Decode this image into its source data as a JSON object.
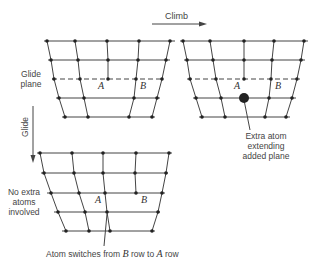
{
  "labels": {
    "climb": "Climb",
    "glide": "Glide",
    "glide_plane_l1": "Glide",
    "glide_plane_l2": "plane",
    "extra_atom_l1": "Extra atom",
    "extra_atom_l2": "extending",
    "extra_atom_l3": "added plane",
    "no_extra_l1": "No extra",
    "no_extra_l2": "atoms",
    "no_extra_l3": "involved",
    "switch_caption_pre": "Atom switches from ",
    "switch_caption_b": "B",
    "switch_caption_mid": " row to ",
    "switch_caption_a": "A",
    "switch_caption_post": " row"
  },
  "atom_labels": {
    "top_left_A": "A",
    "top_left_B": "B",
    "top_right_A": "A",
    "top_right_B": "B",
    "bottom_A": "A",
    "bottom_B": "B"
  },
  "colors": {
    "line": "#444444",
    "atom": "#222222"
  }
}
